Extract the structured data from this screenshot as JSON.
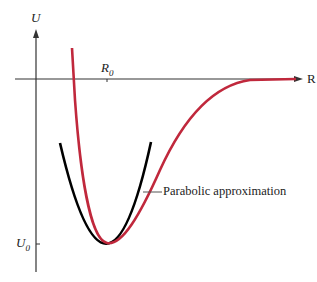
{
  "diagram": {
    "axes": {
      "y_label": "U",
      "x_label": "R",
      "x_tick_label": {
        "main": "R",
        "sub": "0"
      },
      "y_tick_label": {
        "main": "U",
        "sub": "0"
      }
    },
    "curves": [
      {
        "name": "potential-curve",
        "color": "#c0283c"
      },
      {
        "name": "parabolic-approximation",
        "color": "#000000"
      }
    ],
    "annotation": "Parabolic approximation"
  }
}
